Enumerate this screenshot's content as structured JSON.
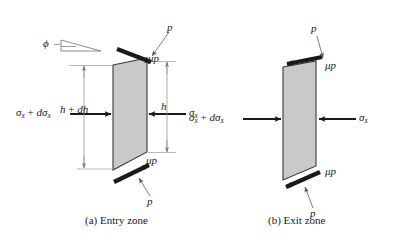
{
  "figure": {
    "background_color": "#ffffff",
    "ink_color": "#1a1a1a",
    "slab_fill_color": "#c9c9c9",
    "slab_edge_color": "#3a3a3a",
    "thin_line_color": "#8a8a8a"
  },
  "panels": [
    {
      "id": "entry",
      "caption": "(a) Entry zone",
      "labels": {
        "pressure_top": "p",
        "pressure_bottom": "p",
        "friction_top": "μp",
        "friction_bottom": "μp",
        "angle": "ϕ",
        "height_left": "h + dh",
        "height_right": "h",
        "stress_left": "σx + dσx",
        "stress_right": "σx"
      }
    },
    {
      "id": "exit",
      "caption": "(b) Exit zone",
      "labels": {
        "pressure_top": "p",
        "pressure_bottom": "p",
        "friction_top": "μp",
        "friction_bottom": "μp",
        "stress_left": "σx + dσx",
        "stress_right": "σx"
      }
    }
  ],
  "symbols": {
    "sigma": "σ",
    "mu": "μ",
    "phi": "ϕ",
    "plus": "+",
    "d": "d",
    "h": "h",
    "p": "p",
    "x": "x"
  },
  "captions": {
    "entry": "(a) Entry zone",
    "exit": "(b) Exit zone"
  }
}
